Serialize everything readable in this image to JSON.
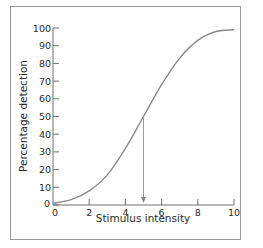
{
  "chart_data": {
    "type": "line",
    "title": "",
    "xlabel": "Stimulus intensity",
    "ylabel": "Percentage detection",
    "xlim": [
      0,
      10
    ],
    "ylim": [
      0,
      100
    ],
    "x_ticks": [
      "0",
      "2",
      "4",
      "6",
      "8",
      "10"
    ],
    "y_ticks": [
      "0",
      "10",
      "20",
      "30",
      "40",
      "50",
      "60",
      "70",
      "80",
      "90",
      "100"
    ],
    "grid": false,
    "legend": null,
    "series": [
      {
        "name": "Psychometric function",
        "x": [
          0,
          1,
          2,
          3,
          4,
          5,
          6,
          7,
          8,
          9,
          10
        ],
        "y": [
          1,
          3,
          8,
          17,
          32,
          50,
          68,
          83,
          93,
          98,
          99
        ]
      }
    ],
    "annotations": [
      {
        "type": "vertical-arrow",
        "x": 5,
        "from_y": 50,
        "to_y": 0,
        "label": "threshold (50% detection)"
      }
    ],
    "colors": {
      "curve": "#8a8a8a",
      "axis": "#6f6f6f",
      "frame": "#9a9a9a"
    }
  }
}
